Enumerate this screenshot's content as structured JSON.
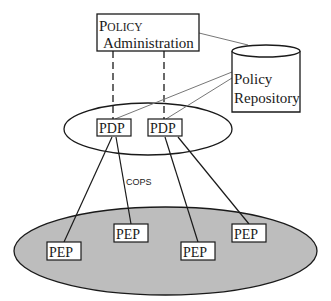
{
  "diagram": {
    "admin": {
      "line1_cap": "P",
      "line1_rest": "OLICY",
      "line2": "Administration"
    },
    "repository": {
      "line1": "Policy",
      "line2": "Repository"
    },
    "pdp_nodes": [
      {
        "label": "PDP"
      },
      {
        "label": "PDP"
      }
    ],
    "protocol_label": "COPS",
    "pep_nodes": [
      {
        "label": "PEP"
      },
      {
        "label": "PEP"
      },
      {
        "label": "PEP"
      },
      {
        "label": "PEP"
      }
    ],
    "colors": {
      "line": "#1a1a1a",
      "gray_line": "#777777",
      "pep_domain_fill": "#bdbdbd"
    }
  }
}
